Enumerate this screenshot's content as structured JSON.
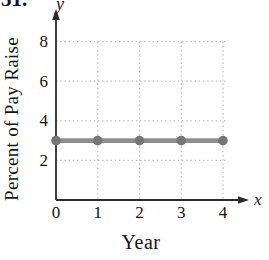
{
  "figure": {
    "exercise_number": "31.",
    "x_axis_letter": "x",
    "y_axis_letter": "y"
  },
  "chart_data": {
    "type": "line",
    "title": "",
    "xlabel": "Year",
    "ylabel": "Percent of Pay Raise",
    "x": [
      0,
      1,
      2,
      3,
      4
    ],
    "series": [
      {
        "name": "percent-of-pay-raise",
        "values": [
          3,
          3,
          3,
          3,
          3
        ]
      }
    ],
    "xticks": [
      0,
      1,
      2,
      3,
      4
    ],
    "yticks": [
      2,
      4,
      6,
      8
    ],
    "xlim": [
      0,
      4.6
    ],
    "ylim": [
      0,
      9.5
    ],
    "grid": "dotted",
    "legend": "none",
    "colors": {
      "line": "#8d8d8d",
      "marker": "#767676",
      "axis": "#2b2b2b",
      "grid": "#bdbdbd",
      "tick_text": "#141414",
      "background": "#ffffff"
    }
  }
}
